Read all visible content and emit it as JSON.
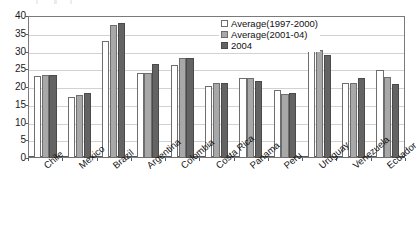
{
  "chart_data": {
    "type": "bar",
    "title": "",
    "xlabel": "",
    "ylabel": "",
    "ylim": [
      0,
      40
    ],
    "ytick_step": 5,
    "yticks": [
      40,
      35,
      30,
      25,
      20,
      15,
      10,
      5,
      0
    ],
    "grid": true,
    "legend_position": "top-right-inside",
    "categories": [
      "Chile",
      "Mexico",
      "Brazil",
      "Argentina",
      "Colombia",
      "Costa Rica",
      "Panama",
      "Peru",
      "Uruguay",
      "Venezuela",
      "Ecuador"
    ],
    "series": [
      {
        "name": "Average(1997-2000)",
        "color": "#ffffff",
        "values": [
          23.2,
          17.2,
          33.1,
          24.0,
          26.3,
          20.3,
          22.5,
          19.3,
          30.3,
          21.0,
          24.7
        ]
      },
      {
        "name": "Average(2001-04)",
        "color": "#a8a8a8",
        "values": [
          23.5,
          17.8,
          37.4,
          24.0,
          28.2,
          21.0,
          22.5,
          18.0,
          30.5,
          21.2,
          22.8
        ]
      },
      {
        "name": "2004",
        "color": "#636363",
        "values": [
          23.4,
          18.3,
          38.0,
          26.5,
          28.2,
          21.0,
          21.8,
          18.2,
          29.0,
          22.5,
          20.8
        ]
      }
    ]
  },
  "legend": {
    "items": [
      {
        "label": "Average(1997-2000)",
        "swatch": "legend-swatch-series-0"
      },
      {
        "label": "Average(2001-04)",
        "swatch": "legend-swatch-series-1"
      },
      {
        "label": "2004",
        "swatch": "legend-swatch-series-2"
      }
    ]
  },
  "axes": {
    "y": {
      "labels": [
        "40",
        "35",
        "30",
        "25",
        "20",
        "15",
        "10",
        "5",
        "0"
      ]
    },
    "x": {
      "labels": [
        "Chile",
        "Mexico",
        "Brazil",
        "Argentina",
        "Colombia",
        "Costa Rica",
        "Panama",
        "Peru",
        "Uruguay",
        "Venezuela",
        "Ecuador"
      ]
    }
  },
  "colors": {
    "series_0": "#ffffff",
    "series_1": "#a8a8a8",
    "series_2": "#636363",
    "grid": "#d2d2d2",
    "axis": "#5a5a5a",
    "text": "#111111"
  }
}
